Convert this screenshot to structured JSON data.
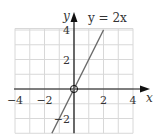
{
  "chart_data": {
    "type": "line",
    "title": "",
    "xlabel": "x",
    "ylabel": "y",
    "xlim": [
      -4,
      4
    ],
    "ylim": [
      -3,
      4.1
    ],
    "grid": true,
    "grid_step": 1,
    "x_ticks": [
      -4,
      -2,
      2,
      4
    ],
    "y_ticks": [
      -2,
      2,
      4
    ],
    "x_tick_labels": [
      "−4",
      "−2",
      "2",
      "4"
    ],
    "y_tick_labels": [
      "−2",
      "2",
      "4"
    ],
    "series": [
      {
        "name": "y = 2x",
        "equation": "y = 2x",
        "x": [
          -1.5,
          2
        ],
        "y": [
          -3,
          4
        ],
        "color": "#6a6a6a"
      }
    ],
    "annotations": [
      {
        "text": "y = 2x",
        "position": "upper right of line end"
      },
      {
        "text": "open circle at origin",
        "x": 0,
        "y": 0
      }
    ],
    "origin_label": "O"
  },
  "labels": {
    "equation": "y = 2x",
    "x_axis": "x",
    "y_axis": "y"
  },
  "colors": {
    "grid": "#d8d8d8",
    "axis": "#111111",
    "line": "#6a6a6a",
    "text": "#333333"
  }
}
